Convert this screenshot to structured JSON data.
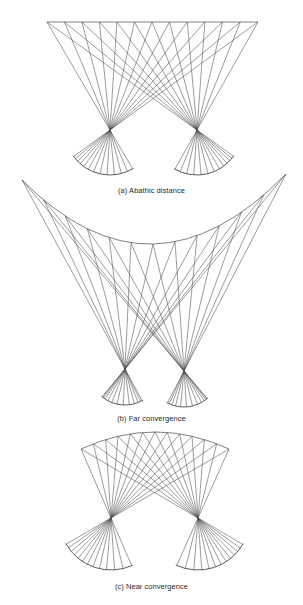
{
  "figure": {
    "line_color": "#4a4a4a",
    "background": "#ffffff",
    "panels": [
      {
        "id": "a",
        "caption": "(a) Abathic distance",
        "horopter_shape": "flat",
        "target_points": 13
      },
      {
        "id": "b",
        "caption": "(b) Far convergence",
        "horopter_shape": "concave",
        "target_points": 13
      },
      {
        "id": "c",
        "caption": "(c) Near convergence",
        "horopter_shape": "convex",
        "target_points": 13
      }
    ]
  }
}
